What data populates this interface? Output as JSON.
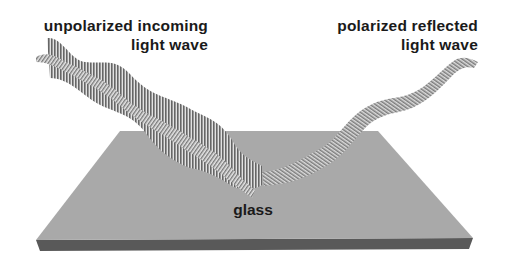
{
  "diagram": {
    "labels": {
      "incoming": [
        "unpolarized incoming",
        "light wave"
      ],
      "reflected": [
        "polarized reflected",
        "light wave"
      ],
      "surface": "glass"
    },
    "colors": {
      "background": "#ffffff",
      "glass_top": "#a9a9a9",
      "glass_edge": "#595959",
      "wave_stripe_dark": "#6e6e6e",
      "wave_stripe_light": "#d8d8d8",
      "text": "#1a1a1a"
    },
    "elements": [
      {
        "id": "incoming-wave",
        "type": "unpolarized wave",
        "direction": "down-right toward glass"
      },
      {
        "id": "reflected-wave",
        "type": "polarized wave",
        "direction": "up-right away from glass"
      },
      {
        "id": "glass-slab",
        "type": "plate"
      }
    ]
  }
}
